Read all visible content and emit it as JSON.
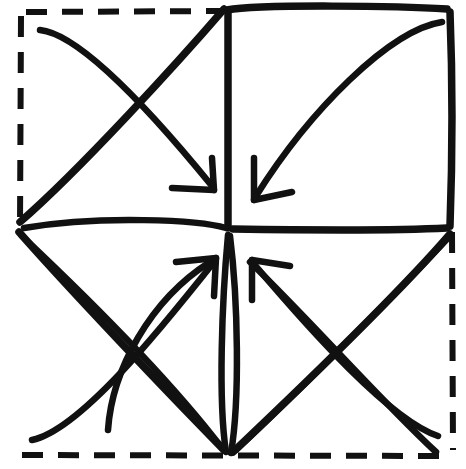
{
  "figure": {
    "background_color": "#ffffff",
    "ink_color": "#111111",
    "canvas": {
      "width": 466,
      "height": 469
    }
  },
  "geometry": {
    "center": {
      "x": 228,
      "y": 231
    },
    "dashed_outline": {
      "name": "original-square-outline",
      "style": "dashed",
      "left": 20,
      "top": 10,
      "right": 452,
      "bottom": 455
    },
    "solid_square": {
      "name": "folded-square-outline",
      "style": "solid",
      "top_left": {
        "x": 228,
        "y": 8
      },
      "top_right": {
        "x": 450,
        "y": 8
      },
      "bottom_right": {
        "x": 450,
        "y": 228
      },
      "bottom_left": {
        "x": 228,
        "y": 228
      }
    },
    "diamond_vertices": {
      "top": {
        "x": 228,
        "y": 8
      },
      "left": {
        "x": 18,
        "y": 225
      },
      "bottom": {
        "x": 228,
        "y": 455
      },
      "right": {
        "x": 450,
        "y": 228
      }
    }
  },
  "strokes": {
    "dashed_top": "M 26 12 L 224 11",
    "dashed_left": "M 21 16 L 20 228",
    "dashed_right": "M 452 232 L 453 450",
    "dashed_bottom": "M 22 455 L 452 456",
    "square_top": "M 227 10 C 260 4 400 6 447 9",
    "square_right": "M 450 12 C 453 90 452 170 450 226",
    "square_bottom": "M 447 228 C 390 231 300 230 233 229",
    "square_left": "M 228 12 L 228 228",
    "diamond_upper_left": "M 224 9 C 180 60 80 170 20 222",
    "diamond_lower_left": "M 19 232 C 70 290 170 395 224 450",
    "diamond_lower_right": "M 450 234 C 400 292 290 398 233 452",
    "fold_tl_to_center": "M 24 228 C 100 215 200 220 226 228",
    "lens_left": "M 228 235 C 222 300 218 400 226 452",
    "lens_right": "M 230 236 C 238 300 240 400 231 453",
    "bl_diag_a": "M 22 236 C 90 300 170 380 222 448",
    "bl_diag_b": "M 108 430 C 112 370 150 300 210 262",
    "br_diag_a": "M 448 238 C 390 300 300 390 236 450",
    "br_diag_b": "M 250 262 C 310 320 380 400 436 452",
    "arrow_tl_shaft": "M 40 30 C 80 34 150 110 212 186",
    "arrow_tl_head_a": "M 214 190 L 172 188",
    "arrow_tl_head_b": "M 214 190 L 212 158",
    "arrow_tr_shaft": "M 442 22 C 390 30 310 110 256 196",
    "arrow_tr_head_a": "M 254 200 L 254 158",
    "arrow_tr_head_b": "M 254 200 L 292 192",
    "arrow_bl_shaft": "M 32 440 C 80 430 160 330 214 262",
    "arrow_bl_head_a": "M 216 258 L 176 262",
    "arrow_bl_head_b": "M 216 258 L 214 296",
    "arrow_br_shaft": "M 438 436 C 390 420 310 330 254 264",
    "arrow_br_head_a": "M 252 260 L 252 300",
    "arrow_br_head_b": "M 252 260 L 290 266"
  },
  "elements": [
    {
      "name": "dashed-outline",
      "label": "Original square outline (dashed)"
    },
    {
      "name": "folded-square",
      "label": "Folded square (solid)"
    },
    {
      "name": "diamond-fold-edges",
      "label": "Diamond fold edges"
    },
    {
      "name": "valley-fold-diagonals",
      "label": "Diagonal valley folds"
    },
    {
      "name": "arrow-top-left",
      "label": "Fold arrow from top-left to center"
    },
    {
      "name": "arrow-top-right",
      "label": "Fold arrow from top-right to center"
    },
    {
      "name": "arrow-bottom-left",
      "label": "Fold arrow from bottom-left to center"
    },
    {
      "name": "arrow-bottom-right",
      "label": "Fold arrow from bottom-right to center"
    }
  ]
}
